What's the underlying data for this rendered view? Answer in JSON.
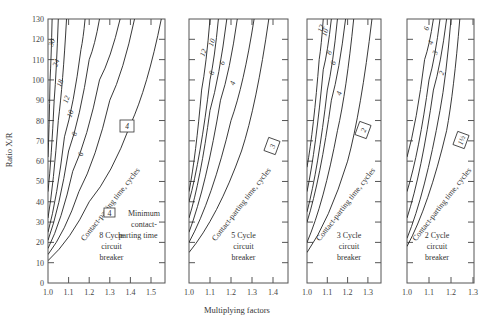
{
  "chart_data": {
    "type": "line",
    "title": "",
    "ylabel": "Ratio X/R",
    "xlabel": "Multiplying factors",
    "ylim": [
      0,
      130
    ],
    "yticks": [
      0,
      10,
      20,
      30,
      40,
      50,
      60,
      70,
      80,
      90,
      100,
      110,
      120,
      130
    ],
    "grid": false,
    "curve_family_label": "Contact-parting time, cycles",
    "legend": {
      "boxed_value_meaning": "Minimum contact-parting time"
    },
    "panels": [
      {
        "name": "8 Cycle circuit breaker",
        "caption": [
          "8 Cycle",
          "circuit",
          "breaker"
        ],
        "xlim": [
          1.0,
          1.57
        ],
        "xticks": [
          "1.0",
          "1.1",
          "1.2",
          "1.3",
          "1.4",
          "1.5"
        ],
        "minimum_contact_parting_time": "4",
        "series": [
          {
            "name": "30",
            "points": [
              [
                1.0,
                62
              ],
              [
                1.01,
                100
              ],
              [
                1.02,
                130
              ]
            ]
          },
          {
            "name": "24",
            "points": [
              [
                1.0,
                45
              ],
              [
                1.03,
                90
              ],
              [
                1.05,
                130
              ]
            ]
          },
          {
            "name": "18",
            "points": [
              [
                1.0,
                32
              ],
              [
                1.05,
                80
              ],
              [
                1.09,
                130
              ]
            ]
          },
          {
            "name": "12",
            "points": [
              [
                1.0,
                25
              ],
              [
                1.08,
                72
              ],
              [
                1.16,
                115
              ],
              [
                1.18,
                130
              ]
            ]
          },
          {
            "name": "10",
            "points": [
              [
                1.0,
                21
              ],
              [
                1.1,
                65
              ],
              [
                1.2,
                110
              ],
              [
                1.25,
                130
              ]
            ]
          },
          {
            "name": "8",
            "points": [
              [
                1.0,
                17
              ],
              [
                1.12,
                55
              ],
              [
                1.25,
                100
              ],
              [
                1.35,
                130
              ]
            ]
          },
          {
            "name": "6",
            "points": [
              [
                1.0,
                14
              ],
              [
                1.15,
                45
              ],
              [
                1.3,
                90
              ],
              [
                1.42,
                130
              ]
            ]
          },
          {
            "name": "4",
            "points": [
              [
                1.0,
                11
              ],
              [
                1.2,
                40
              ],
              [
                1.4,
                78
              ],
              [
                1.55,
                130
              ]
            ]
          }
        ]
      },
      {
        "name": "5 Cycle circuit breaker",
        "caption": [
          "5 Cycle",
          "circuit",
          "breaker"
        ],
        "xlim": [
          1.0,
          1.47
        ],
        "xticks": [
          "1.0",
          "1.1",
          "1.2",
          "1.3",
          "1.4"
        ],
        "series": [
          {
            "name": "12",
            "points": [
              [
                1.0,
                45
              ],
              [
                1.06,
                95
              ],
              [
                1.1,
                130
              ]
            ]
          },
          {
            "name": "10",
            "points": [
              [
                1.0,
                40
              ],
              [
                1.1,
                100
              ],
              [
                1.14,
                130
              ]
            ]
          },
          {
            "name": "8",
            "points": [
              [
                1.0,
                32
              ],
              [
                1.1,
                85
              ],
              [
                1.18,
                130
              ]
            ]
          },
          {
            "name": "6",
            "points": [
              [
                1.0,
                25
              ],
              [
                1.15,
                90
              ],
              [
                1.23,
                130
              ]
            ]
          },
          {
            "name": "4",
            "points": [
              [
                1.0,
                20
              ],
              [
                1.2,
                80
              ],
              [
                1.31,
                130
              ]
            ]
          },
          {
            "name": "3",
            "points": [
              [
                1.0,
                15
              ],
              [
                1.25,
                65
              ],
              [
                1.38,
                130
              ]
            ]
          }
        ]
      },
      {
        "name": "3 Cycle circuit breaker",
        "caption": [
          "3 Cycle",
          "circuit",
          "breaker"
        ],
        "xlim": [
          1.0,
          1.36
        ],
        "xticks": [
          "1.0",
          "1.1",
          "1.2",
          "1.3"
        ],
        "series": [
          {
            "name": "12",
            "points": [
              [
                1.0,
                57
              ],
              [
                1.06,
                110
              ],
              [
                1.08,
                130
              ]
            ]
          },
          {
            "name": "10",
            "points": [
              [
                1.0,
                45
              ],
              [
                1.08,
                105
              ],
              [
                1.12,
                130
              ]
            ]
          },
          {
            "name": "8",
            "points": [
              [
                1.0,
                35
              ],
              [
                1.1,
                95
              ],
              [
                1.15,
                130
              ]
            ]
          },
          {
            "name": "6",
            "points": [
              [
                1.0,
                30
              ],
              [
                1.12,
                90
              ],
              [
                1.19,
                130
              ]
            ]
          },
          {
            "name": "4",
            "points": [
              [
                1.0,
                20
              ],
              [
                1.15,
                75
              ],
              [
                1.23,
                130
              ]
            ]
          },
          {
            "name": "2",
            "points": [
              [
                1.0,
                15
              ],
              [
                1.2,
                60
              ],
              [
                1.32,
                130
              ]
            ]
          }
        ]
      },
      {
        "name": "2 Cycle circuit breaker",
        "caption": [
          "2 Cycle",
          "circuit",
          "breaker"
        ],
        "xlim": [
          1.0,
          1.3
        ],
        "xticks": [
          "1.0",
          "1.1",
          "1.2",
          "1.3"
        ],
        "series": [
          {
            "name": "6",
            "points": [
              [
                1.0,
                62
              ],
              [
                1.08,
                110
              ],
              [
                1.12,
                130
              ]
            ]
          },
          {
            "name": "4",
            "points": [
              [
                1.0,
                45
              ],
              [
                1.1,
                100
              ],
              [
                1.15,
                130
              ]
            ]
          },
          {
            "name": "3",
            "points": [
              [
                1.0,
                32
              ],
              [
                1.12,
                95
              ],
              [
                1.18,
                130
              ]
            ]
          },
          {
            "name": "2",
            "points": [
              [
                1.0,
                22
              ],
              [
                1.15,
                85
              ],
              [
                1.2,
                130
              ]
            ]
          },
          {
            "name": "1½",
            "points": [
              [
                1.0,
                18
              ],
              [
                1.18,
                75
              ],
              [
                1.24,
                130
              ]
            ]
          }
        ]
      }
    ]
  },
  "labels": {
    "ylabel": "Ratio X/R",
    "xlabel": "Multiplying factors",
    "min_note_1": "Minimum",
    "min_note_2": "contact-",
    "min_note_3": "parting time"
  }
}
